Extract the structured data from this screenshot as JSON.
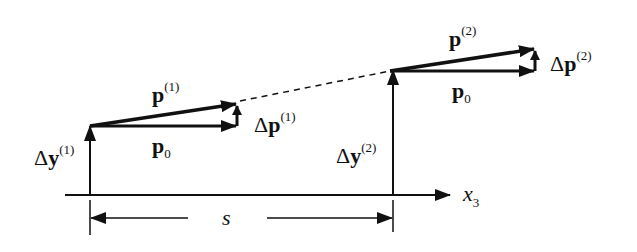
{
  "diagram": {
    "labels": {
      "p1": "p",
      "p1_sup": "(1)",
      "p0_left": "p",
      "p0_left_sub": "0",
      "dp1_delta": "Δ",
      "dp1": "p",
      "dp1_sup": "(1)",
      "dy1_delta": "Δ",
      "dy1": "y",
      "dy1_sup": "(1)",
      "p2": "p",
      "p2_sup": "(2)",
      "p0_right": "p",
      "p0_right_sub": "0",
      "dp2_delta": "Δ",
      "dp2": "p",
      "dp2_sup": "(2)",
      "dy2_delta": "Δ",
      "dy2": "y",
      "dy2_sup": "(2)",
      "axis": "x",
      "axis_sub": "3",
      "distance": "s"
    },
    "colors": {
      "stroke": "#111111",
      "background": "#ffffff"
    }
  }
}
